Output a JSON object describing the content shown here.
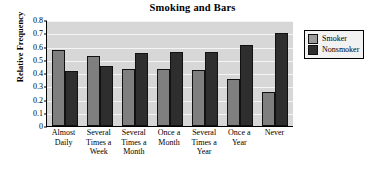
{
  "chart_data": {
    "type": "bar",
    "title": "Smoking and Bars",
    "xlabel": "",
    "ylabel": "Relative Frequency",
    "categories": [
      "Almost Daily",
      "Several Times a Week",
      "Several Times a Month",
      "Once a Month",
      "Several Times a Year",
      "Once a Year",
      "Never"
    ],
    "category_lines": [
      [
        "Almost",
        "Daily"
      ],
      [
        "Several",
        "Times a",
        "Week"
      ],
      [
        "Several",
        "Times a",
        "Month"
      ],
      [
        "Once a",
        "Month"
      ],
      [
        "Several",
        "Times a",
        "Year"
      ],
      [
        "Once a",
        "Year"
      ],
      [
        "Never"
      ]
    ],
    "series": [
      {
        "name": "Smoker",
        "color": "#7f7f7f",
        "values": [
          0.575,
          0.53,
          0.43,
          0.43,
          0.42,
          0.355,
          0.26
        ]
      },
      {
        "name": "Nonsmoker",
        "color": "#2e2e2e",
        "values": [
          0.415,
          0.455,
          0.55,
          0.555,
          0.56,
          0.615,
          0.705
        ]
      }
    ],
    "ylim": [
      0,
      0.8
    ],
    "yticks": [
      0,
      0.1,
      0.2,
      0.3,
      0.4,
      0.5,
      0.6,
      0.7,
      0.8
    ],
    "ytick_labels": [
      "0",
      "0.1",
      "0.2",
      "0.3",
      "0.4",
      "0.5",
      "0.6",
      "0.7",
      "0.8"
    ],
    "grid": true,
    "legend_position": "right",
    "plot_background": "#d7d7d7",
    "gridline_color": "#f4f4f4"
  }
}
